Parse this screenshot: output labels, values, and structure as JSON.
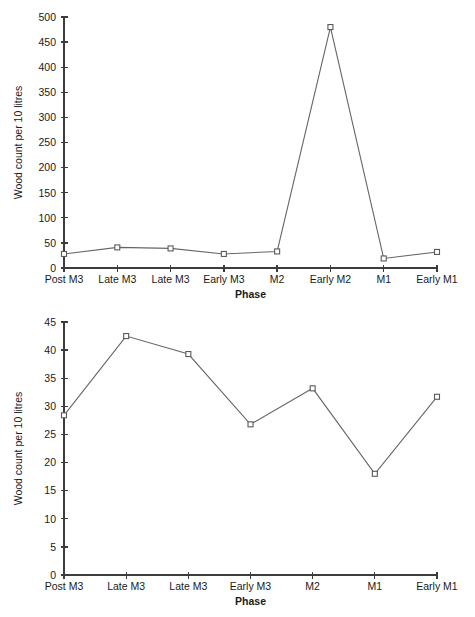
{
  "chart_data": [
    {
      "id": "top",
      "type": "line",
      "title": "",
      "xlabel": "Phase",
      "ylabel": "Wood count per 10 litres",
      "categories": [
        "Post M3",
        "Late M3",
        "Late M3",
        "Early M3",
        "M2",
        "Early M2",
        "M1",
        "Early M1"
      ],
      "values": [
        28,
        41,
        39,
        28,
        33,
        480,
        19,
        32
      ],
      "ylim": [
        0,
        500
      ],
      "ytick_step": 50,
      "yticks": [
        0,
        50,
        100,
        150,
        200,
        250,
        300,
        350,
        400,
        450,
        500
      ],
      "ytick_labels": [
        "0",
        "50",
        "100",
        "150",
        "200",
        "250",
        "300",
        "350",
        "400",
        "450",
        "500"
      ],
      "grid": false,
      "legend": false,
      "marker": "open-square",
      "line_color": "#666666",
      "marker_edge_color": "#5a5a5a",
      "marker_face_color": "#ffffff",
      "axis_color": "#3c3c3c"
    },
    {
      "id": "bottom",
      "type": "line",
      "title": "",
      "xlabel": "Phase",
      "ylabel": "Wood count per 10 litres",
      "categories": [
        "Post M3",
        "Late M3",
        "Late M3",
        "Early M3",
        "M2",
        "M1",
        "Early M1"
      ],
      "values": [
        28.4,
        42.5,
        39.3,
        26.8,
        33.2,
        18.0,
        31.7
      ],
      "ylim": [
        0,
        45
      ],
      "ytick_step": 5,
      "yticks": [
        0,
        5,
        10,
        15,
        20,
        25,
        30,
        35,
        40,
        45
      ],
      "ytick_labels": [
        "0",
        "5",
        "10",
        "15",
        "20",
        "25",
        "30",
        "35",
        "40",
        "45"
      ],
      "grid": false,
      "legend": false,
      "marker": "open-square",
      "line_color": "#666666",
      "marker_edge_color": "#5a5a5a",
      "marker_face_color": "#ffffff",
      "axis_color": "#3c3c3c"
    }
  ]
}
